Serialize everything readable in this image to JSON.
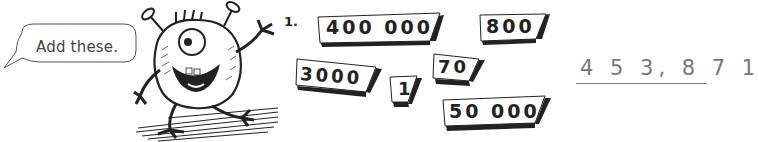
{
  "speech_bubble": {
    "text": "Add these."
  },
  "problem": {
    "number_label": "1.",
    "addends": [
      {
        "id": "card-400000",
        "value": "400 000"
      },
      {
        "id": "card-800",
        "value": "800"
      },
      {
        "id": "card-3000",
        "value": "3000"
      },
      {
        "id": "card-1",
        "value": "1"
      },
      {
        "id": "card-70",
        "value": "70"
      },
      {
        "id": "card-50000",
        "value": "50 000"
      }
    ],
    "answer": "4 5 3, 8 7 1"
  },
  "illustration": {
    "icon": "one-eyed-monster-icon"
  },
  "colors": {
    "ink": "#222222",
    "answer": "#777777",
    "background": "#ffffff"
  }
}
